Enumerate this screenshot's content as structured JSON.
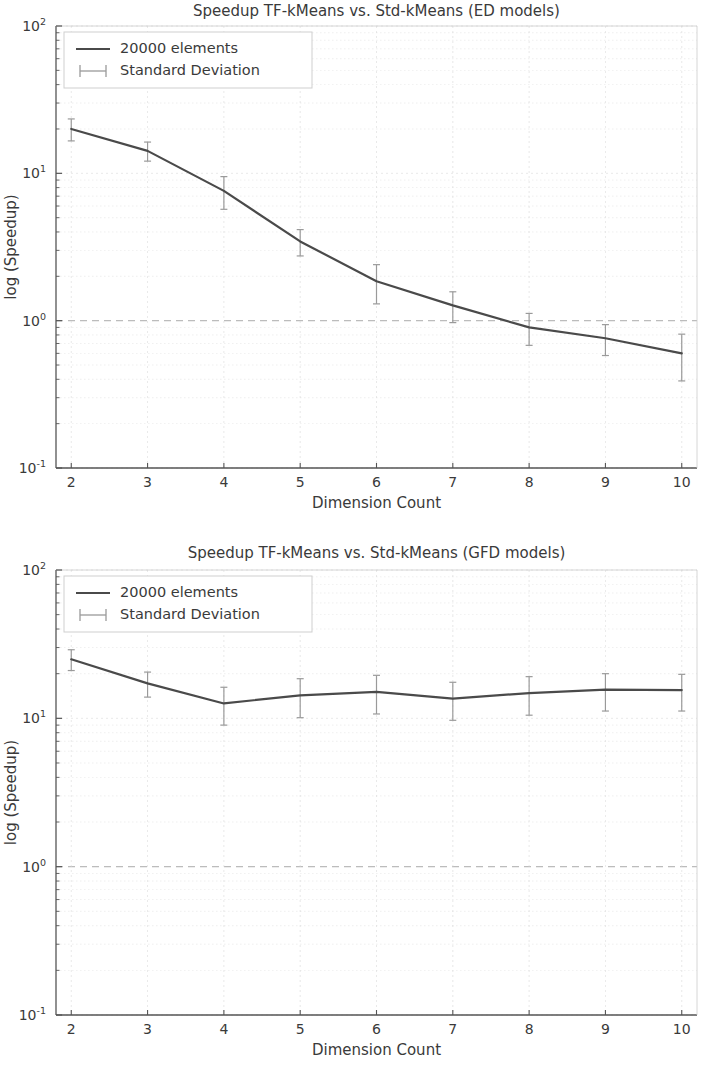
{
  "figure": {
    "background": "#ffffff",
    "line_color": "#4a4a4a",
    "errorbar_color": "#9a9a9a",
    "grid_color": "#d8d8d8",
    "unit_gridline_color": "#b9b9b9",
    "axis_color": "#555555"
  },
  "panels": [
    {
      "id": "ed",
      "legend": {
        "series_label": "20000 elements",
        "errorbar_label": "Standard Deviation"
      },
      "chart_data": {
        "type": "line",
        "title": "Speedup TF-kMeans vs. Std-kMeans (ED models)",
        "xlabel": "Dimension Count",
        "ylabel": "log (Speedup)",
        "yscale": "log",
        "xscale": "linear",
        "grid": true,
        "legend_position": "upper left",
        "xlim": [
          1.8,
          10.2
        ],
        "ylim": [
          0.1,
          100
        ],
        "xticks": [
          2,
          3,
          4,
          5,
          6,
          7,
          8,
          9,
          10
        ],
        "yticks": [
          0.1,
          1,
          10,
          100
        ],
        "ytick_labels": [
          "10^-1",
          "10^0",
          "10^1",
          "10^2"
        ],
        "x": [
          2,
          3,
          4,
          5,
          6,
          7,
          8,
          9,
          10
        ],
        "series": [
          {
            "name": "20000 elements",
            "values": [
              20.0,
              14.2,
              7.6,
              3.45,
              1.85,
              1.27,
              0.9,
              0.76,
              0.6
            ],
            "errors": [
              3.4,
              2.1,
              1.9,
              0.7,
              0.55,
              0.3,
              0.22,
              0.18,
              0.21
            ]
          }
        ],
        "reference_line": {
          "y": 1.0,
          "style": "dashed"
        }
      }
    },
    {
      "id": "gfd",
      "legend": {
        "series_label": "20000 elements",
        "errorbar_label": "Standard Deviation"
      },
      "chart_data": {
        "type": "line",
        "title": "Speedup TF-kMeans vs. Std-kMeans (GFD models)",
        "xlabel": "Dimension Count",
        "ylabel": "log (Speedup)",
        "yscale": "log",
        "xscale": "linear",
        "grid": true,
        "legend_position": "upper left",
        "xlim": [
          1.8,
          10.2
        ],
        "ylim": [
          0.1,
          100
        ],
        "xticks": [
          2,
          3,
          4,
          5,
          6,
          7,
          8,
          9,
          10
        ],
        "yticks": [
          0.1,
          1,
          10,
          100
        ],
        "ytick_labels": [
          "10^-1",
          "10^0",
          "10^1",
          "10^2"
        ],
        "x": [
          2,
          3,
          4,
          5,
          6,
          7,
          8,
          9,
          10
        ],
        "series": [
          {
            "name": "20000 elements",
            "values": [
              25.0,
              17.2,
              12.6,
              14.3,
              15.1,
              13.6,
              14.8,
              15.6,
              15.5
            ],
            "errors": [
              4.0,
              3.3,
              3.6,
              4.2,
              4.4,
              3.9,
              4.3,
              4.4,
              4.3
            ]
          }
        ],
        "reference_line": {
          "y": 1.0,
          "style": "dashed"
        }
      }
    }
  ]
}
